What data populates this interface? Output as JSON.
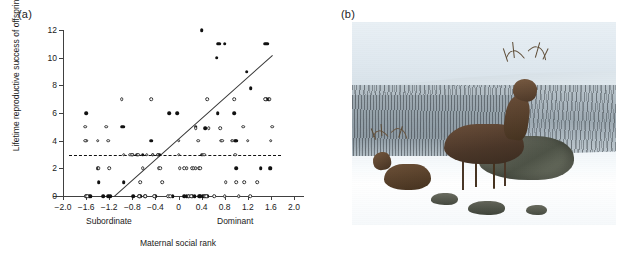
{
  "figure": {
    "panel_a_label": "(a)",
    "panel_b_label": "(b)"
  },
  "chart_data": {
    "type": "scatter",
    "title": "",
    "xlabel": "Maternal social rank",
    "ylabel": "Lifetime reproductive success of offspring",
    "xlim": [
      -2.0,
      2.0
    ],
    "ylim": [
      0,
      12
    ],
    "xticks": [
      "-2.0",
      "-1.6",
      "-1.2",
      "-0.8",
      "-0.4",
      "0",
      "0.4",
      "0.8",
      "1.2",
      "1.6",
      "2.0"
    ],
    "xtick_values": [
      -2.0,
      -1.6,
      -1.2,
      -0.8,
      -0.4,
      0,
      0.4,
      0.8,
      1.2,
      1.6,
      2.0
    ],
    "yticks": [
      "0",
      "2",
      "4",
      "6",
      "8",
      "10",
      "12"
    ],
    "ytick_values": [
      0,
      2,
      4,
      6,
      8,
      10,
      12
    ],
    "grid": false,
    "legend": "none",
    "axis_annotations": [
      {
        "name": "subordinate",
        "text": "Subordinate",
        "x": -1.25
      },
      {
        "name": "dominant",
        "text": "Dominant",
        "x": 0.95
      }
    ],
    "series": [
      {
        "name": "Sons (filled circles)",
        "marker": "filled-circle",
        "points": [
          [
            -1.6,
            6
          ],
          [
            -1.6,
            0
          ],
          [
            -1.55,
            0
          ],
          [
            -1.52,
            0
          ],
          [
            -1.4,
            2
          ],
          [
            -1.38,
            1
          ],
          [
            -1.3,
            0
          ],
          [
            -1.22,
            0
          ],
          [
            -1.18,
            0
          ],
          [
            -0.98,
            5
          ],
          [
            -0.96,
            5
          ],
          [
            -0.95,
            1
          ],
          [
            -0.8,
            3
          ],
          [
            -0.78,
            0
          ],
          [
            -0.72,
            3
          ],
          [
            -0.68,
            0
          ],
          [
            -0.66,
            0
          ],
          [
            -0.62,
            3
          ],
          [
            -0.58,
            0
          ],
          [
            -0.47,
            4
          ],
          [
            -0.45,
            3
          ],
          [
            -0.4,
            0
          ],
          [
            -0.36,
            3
          ],
          [
            -0.33,
            3
          ],
          [
            -0.16,
            6
          ],
          [
            -0.1,
            0
          ],
          [
            -0.02,
            6
          ],
          [
            0.1,
            0
          ],
          [
            0.14,
            0
          ],
          [
            0.18,
            0
          ],
          [
            0.24,
            0
          ],
          [
            0.28,
            0
          ],
          [
            0.3,
            5
          ],
          [
            0.36,
            0
          ],
          [
            0.38,
            0
          ],
          [
            0.4,
            3
          ],
          [
            0.4,
            12
          ],
          [
            0.42,
            0
          ],
          [
            0.44,
            0
          ],
          [
            0.46,
            4.9
          ],
          [
            0.5,
            0
          ],
          [
            0.66,
            10
          ],
          [
            0.68,
            11
          ],
          [
            0.7,
            11
          ],
          [
            0.68,
            6
          ],
          [
            0.8,
            11
          ],
          [
            0.96,
            6
          ],
          [
            0.98,
            4
          ],
          [
            1.0,
            2
          ],
          [
            1.0,
            4
          ],
          [
            1.18,
            9
          ],
          [
            1.25,
            7.8
          ],
          [
            1.42,
            2
          ],
          [
            1.5,
            11
          ],
          [
            1.54,
            11
          ],
          [
            1.52,
            7
          ],
          [
            1.56,
            7
          ],
          [
            1.58,
            2
          ],
          [
            1.6,
            2
          ]
        ]
      },
      {
        "name": "Daughters (open circles)",
        "marker": "open-circle",
        "points": [
          [
            -1.62,
            5
          ],
          [
            -1.6,
            4
          ],
          [
            -1.62,
            4
          ],
          [
            -1.6,
            0
          ],
          [
            -1.58,
            0
          ],
          [
            -1.4,
            4
          ],
          [
            -1.38,
            2
          ],
          [
            -1.25,
            5
          ],
          [
            -1.22,
            4
          ],
          [
            -1.2,
            2
          ],
          [
            -0.98,
            7
          ],
          [
            -0.95,
            3
          ],
          [
            -0.84,
            3
          ],
          [
            -0.8,
            3
          ],
          [
            -0.7,
            3
          ],
          [
            -0.68,
            0
          ],
          [
            -0.66,
            1
          ],
          [
            -0.62,
            2
          ],
          [
            -0.58,
            0
          ],
          [
            -0.55,
            3
          ],
          [
            -0.47,
            7
          ],
          [
            -0.45,
            3
          ],
          [
            -0.42,
            0
          ],
          [
            -0.36,
            3
          ],
          [
            -0.34,
            2
          ],
          [
            -0.32,
            2
          ],
          [
            -0.28,
            1
          ],
          [
            -0.18,
            0
          ],
          [
            -0.14,
            0
          ],
          [
            0.0,
            4
          ],
          [
            0.0,
            3
          ],
          [
            0.02,
            2
          ],
          [
            0.1,
            2
          ],
          [
            0.14,
            2
          ],
          [
            0.18,
            0
          ],
          [
            0.22,
            0
          ],
          [
            0.24,
            2
          ],
          [
            0.26,
            2
          ],
          [
            0.3,
            2
          ],
          [
            0.3,
            4.9
          ],
          [
            0.34,
            4
          ],
          [
            0.36,
            2
          ],
          [
            0.38,
            2
          ],
          [
            0.42,
            3
          ],
          [
            0.44,
            3
          ],
          [
            0.46,
            0
          ],
          [
            0.48,
            0
          ],
          [
            0.5,
            7
          ],
          [
            0.52,
            4.9
          ],
          [
            0.62,
            0
          ],
          [
            0.72,
            4.9
          ],
          [
            0.74,
            4
          ],
          [
            0.76,
            4
          ],
          [
            0.8,
            0
          ],
          [
            0.82,
            1
          ],
          [
            0.92,
            4
          ],
          [
            0.94,
            4
          ],
          [
            0.96,
            7
          ],
          [
            0.98,
            3
          ],
          [
            1.0,
            1
          ],
          [
            1.04,
            0
          ],
          [
            1.12,
            5
          ],
          [
            1.14,
            1
          ],
          [
            1.2,
            4
          ],
          [
            1.24,
            0
          ],
          [
            1.36,
            1
          ],
          [
            1.5,
            7
          ],
          [
            1.58,
            7
          ],
          [
            1.6,
            4
          ],
          [
            1.62,
            5
          ]
        ]
      }
    ],
    "lines": [
      {
        "name": "sons-regression",
        "style": "solid",
        "x0": -1.12,
        "y0": 0.0,
        "x1": 1.62,
        "y1": 10.2
      },
      {
        "name": "daughters-regression",
        "style": "dashed",
        "x0": -1.9,
        "y0": 2.98,
        "x1": 1.78,
        "y1": 2.98
      }
    ]
  },
  "photo": {
    "name": "red-deer-stags-in-snow",
    "description": "Two red deer stags standing on a snow-covered hillside with frosted trees behind",
    "subjects": [
      "stag-large-right",
      "stag-small-left",
      "rock-outcrop",
      "snow-slope",
      "frosted-treeline"
    ]
  }
}
